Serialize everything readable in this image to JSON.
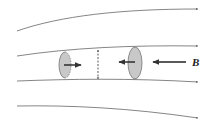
{
  "diagram": {
    "field_label": "B",
    "colors": {
      "line": "#555555",
      "ellipse_fill": "#c8c8c8",
      "ellipse_stroke": "#666666",
      "arrow": "#222222"
    },
    "field_lines": 4,
    "cross_sections": [
      {
        "name": "left",
        "arrow_direction": "right",
        "edge_style": "dashed"
      },
      {
        "name": "right",
        "arrow_direction": "left",
        "edge_style": "solid"
      }
    ],
    "width_marker": "double-headed dashed vertical arrow"
  }
}
